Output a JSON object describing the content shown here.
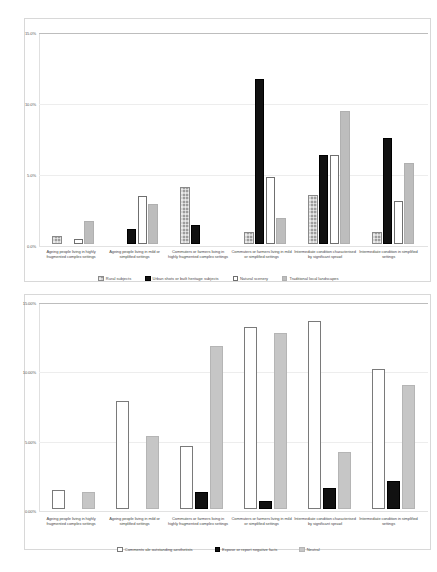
{
  "charts": [
    {
      "id": "upper-chart",
      "chart_data": {
        "type": "bar",
        "title": "",
        "xlabel": "",
        "ylabel": "",
        "ylim": [
          0,
          15
        ],
        "yticks": [
          "0.0%",
          "5.0%",
          "10.0%",
          "15.0%"
        ],
        "ytick_values": [
          0,
          5,
          10,
          15
        ],
        "grid": true,
        "legend_position": "bottom",
        "categories": [
          "Ageing people living in highly fragmented complex settings",
          "Ageing people living in mild or simplified settings",
          "Commuters or farmers living in highly fragmented complex settings",
          "Commuters or farmers living in mild or simplified settings",
          "Intermediate condition characterised by significant sprawl",
          "Intermediate condition in simplified settings"
        ],
        "series": [
          {
            "name": "Rural subjects",
            "swatch": "sw-rural",
            "values": [
              0.55,
              0.0,
              4.05,
              0.85,
              3.45,
              0.85,
              3.35
            ]
          },
          {
            "name": "Urban shots or built heritage subjects",
            "swatch": "sw-urban",
            "values": [
              0.0,
              1.05,
              1.35,
              11.6,
              6.3,
              7.5,
              4.95
            ]
          },
          {
            "name": "Natural scenery",
            "swatch": "sw-natural",
            "values": [
              0.35,
              3.4,
              0.0,
              4.75,
              6.3,
              3.05,
              6.3
            ]
          },
          {
            "name": "Traditional local landscapes",
            "swatch": "sw-trad",
            "values": [
              1.6,
              2.85,
              0.0,
              1.85,
              9.35,
              5.7,
              4.95
            ]
          }
        ]
      }
    },
    {
      "id": "lower-chart",
      "chart_data": {
        "type": "bar",
        "title": "",
        "xlabel": "",
        "ylabel": "",
        "ylim": [
          0,
          15
        ],
        "yticks": [
          "0.00%",
          "5.00%",
          "10.00%",
          "15.00%"
        ],
        "ytick_values": [
          0,
          5,
          10,
          15
        ],
        "grid": true,
        "legend_position": "bottom",
        "categories": [
          "Ageing people living in highly fragmented complex settings",
          "Ageing people living in mild or simplified settings",
          "Commuters or farmers living in highly fragmented complex settings",
          "Commuters or farmers living in mild or simplified settings",
          "Intermediate condition characterised by significant sprawl",
          "Intermediate condition in simplified settings"
        ],
        "series": [
          {
            "name": "Comments ale outstanding aesthetists",
            "swatch": "sw-comments",
            "values": [
              1.35,
              7.8,
              4.55,
              13.1,
              13.55,
              10.1
            ]
          },
          {
            "name": "Expose or report negative facts",
            "swatch": "sw-expose",
            "values": [
              0.0,
              0.0,
              1.25,
              0.55,
              1.55,
              2.0
            ]
          },
          {
            "name": "Neutral",
            "swatch": "sw-neutral",
            "values": [
              1.25,
              5.25,
              11.75,
              12.7,
              4.1,
              8.95
            ]
          }
        ]
      }
    }
  ]
}
